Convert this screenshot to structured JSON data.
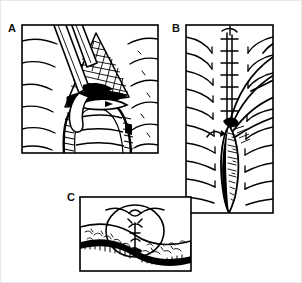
{
  "figure": {
    "kind": "surgical-technique-line-drawing",
    "width": 302,
    "height": 283,
    "background_color": "#ffffff",
    "ink_color": "#000000",
    "frame_color": "#e8e8e8",
    "caption": ""
  },
  "panels": [
    {
      "id": "A",
      "label": "A",
      "label_position": {
        "x": 7,
        "y": 22
      },
      "frame": {
        "x": 21,
        "y": 24,
        "width": 136,
        "height": 128
      },
      "description": "Longitudinal view: a forceps/clamp enters from the upper left holding back a triangular flap of incised tissue; the cross-hatched edges of the opened sheath are retracted to expose an arched tubular structure beneath; horizontal striations represent surrounding tissue planes.",
      "elements": [
        "forceps-instrument",
        "triangular-tissue-flap",
        "hatched-cut-edge",
        "arched-tubular-structure",
        "tissue-striations"
      ]
    },
    {
      "id": "B",
      "label": "B",
      "label_position": {
        "x": 171,
        "y": 22
      },
      "frame": {
        "x": 185,
        "y": 24,
        "width": 87,
        "height": 188
      },
      "description": "Longitudinal view of the closed repair: a ladder-like running suture line runs down the midline; long curved suture strands sweep out to the right and form a large open loop that extends past the panel border; a dark stippled spindle-shaped repair site occupies the lower half, flanked by radiating tissue lines.",
      "elements": [
        "running-suture-ladder",
        "suture-strands",
        "suture-loop",
        "stippled-repair-spindle",
        "tissue-radiating-lines",
        "direction-arrow"
      ]
    },
    {
      "id": "C",
      "label": "C",
      "label_position": {
        "x": 66,
        "y": 191
      },
      "frame": {
        "x": 79,
        "y": 196,
        "width": 111,
        "height": 74
      },
      "description": "Cross-sectional view: a circular structure sits within a horizontal band of mottled tissue; a knotted suture with free tails crosses the top of the circle, and a dark cortical layer lines the underside of the tissue band.",
      "elements": [
        "circular-cross-section",
        "mottled-tissue-band",
        "suture-knot",
        "suture-tails",
        "dark-cortical-layer"
      ]
    }
  ]
}
